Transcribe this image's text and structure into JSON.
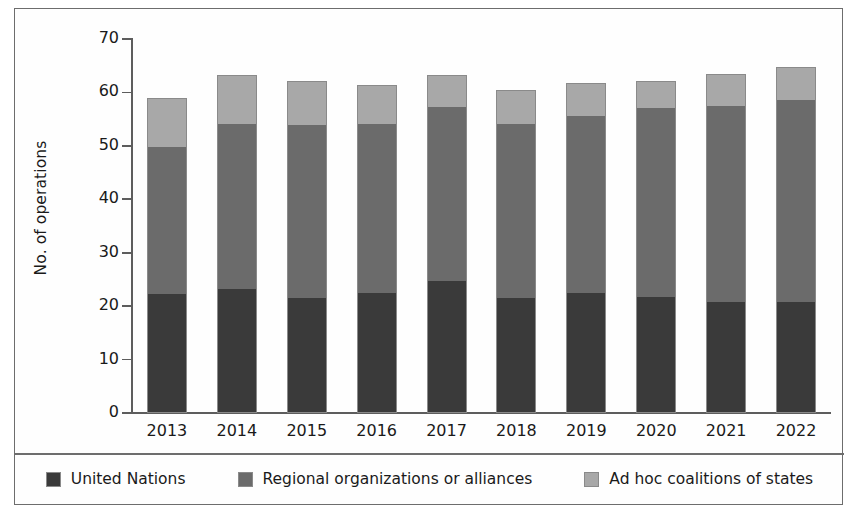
{
  "chart_data": {
    "type": "bar",
    "subtype": "stacked-bar",
    "title": "",
    "xlabel": "",
    "ylabel": "No. of operations",
    "ylim": [
      0,
      70
    ],
    "yticks": [
      0,
      10,
      20,
      30,
      40,
      50,
      60,
      70
    ],
    "grid": false,
    "legend_position": "bottom",
    "categories": [
      "2013",
      "2014",
      "2015",
      "2016",
      "2017",
      "2018",
      "2019",
      "2020",
      "2021",
      "2022"
    ],
    "series": [
      {
        "name": "United Nations",
        "color": "#3a3a3a",
        "values": [
          22.3,
          23.2,
          21.5,
          22.4,
          24.7,
          21.4,
          22.5,
          21.7,
          20.8,
          20.7
        ]
      },
      {
        "name": "Regional organizations or alliances",
        "color": "#6b6b6b",
        "values": [
          27.7,
          31.0,
          32.5,
          31.8,
          32.8,
          32.8,
          33.2,
          35.6,
          36.8,
          38.1
        ]
      },
      {
        "name": "Ad hoc coalitions of states",
        "color": "#a8a8a8",
        "values": [
          9.0,
          9.0,
          8.1,
          7.2,
          5.8,
          6.2,
          6.0,
          4.9,
          5.9,
          6.0
        ]
      }
    ],
    "totals": [
      59.0,
      63.2,
      62.1,
      61.4,
      63.3,
      60.4,
      61.7,
      62.2,
      63.5,
      64.8
    ]
  },
  "axis": {
    "y_label": "No. of operations",
    "y_ticks": [
      {
        "label": "70",
        "value": 70
      },
      {
        "label": "60",
        "value": 60
      },
      {
        "label": "50",
        "value": 50
      },
      {
        "label": "40",
        "value": 40
      },
      {
        "label": "30",
        "value": 30
      },
      {
        "label": "20",
        "value": 20
      },
      {
        "label": "10",
        "value": 10
      },
      {
        "label": "0",
        "value": 0
      }
    ]
  },
  "legend": {
    "items": [
      {
        "label": "United Nations",
        "color": "#3a3a3a"
      },
      {
        "label": "Regional organizations or alliances",
        "color": "#6b6b6b"
      },
      {
        "label": "Ad hoc coalitions of states",
        "color": "#a8a8a8"
      }
    ]
  },
  "colors": {
    "united_nations": "#3a3a3a",
    "regional_organizations": "#6b6b6b",
    "ad_hoc_coalitions": "#a8a8a8",
    "frame": "#6d6d6d",
    "axis": "#5d5d5d",
    "background": "#ffffff"
  }
}
